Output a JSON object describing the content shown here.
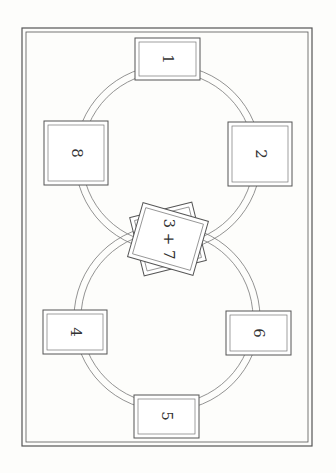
{
  "diagram": {
    "type": "tarot-spread",
    "orientation": "rotated-90",
    "positions": [
      {
        "id": "1",
        "label": "1",
        "cx": 167,
        "cy": 59
      },
      {
        "id": "2",
        "label": "2",
        "cx": 260,
        "cy": 154
      },
      {
        "id": "3+7",
        "label": "3 + 7",
        "cx": 168,
        "cy": 239
      },
      {
        "id": "4",
        "label": "4",
        "cx": 75,
        "cy": 332
      },
      {
        "id": "5",
        "label": "5",
        "cx": 166,
        "cy": 416
      },
      {
        "id": "6",
        "label": "6",
        "cx": 258,
        "cy": 333
      },
      {
        "id": "8",
        "label": "8",
        "cx": 76,
        "cy": 153
      }
    ],
    "colors": {
      "line": "#555555",
      "background": "#fdfdfb",
      "card_fill": "#ffffff"
    }
  }
}
